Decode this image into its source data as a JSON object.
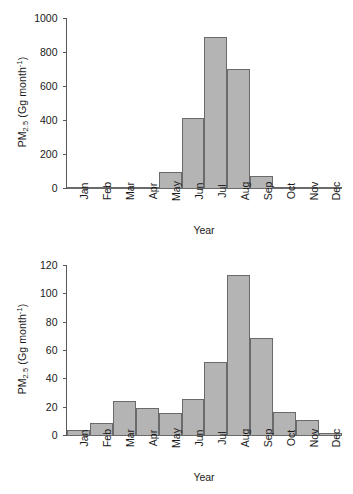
{
  "chart_data": [
    {
      "type": "bar",
      "panel": "top",
      "title": "",
      "xlabel": "Year",
      "ylabel": "PM2.5 (Gg month-1)",
      "ylabel_parts": {
        "prefix": "PM",
        "sub": "2.5",
        "mid": " (Gg month",
        "sup": "-1",
        "suffix": ")"
      },
      "categories": [
        "Jan",
        "Feb",
        "Mar",
        "Apr",
        "May",
        "Jun",
        "Jul",
        "Aug",
        "Sep",
        "Oct",
        "Nov",
        "Dec"
      ],
      "values": [
        2,
        2,
        2,
        3,
        100,
        415,
        897,
        708,
        78,
        14,
        10,
        4
      ],
      "ylim": [
        0,
        1000
      ],
      "yticks": [
        0,
        200,
        400,
        600,
        800,
        1000
      ],
      "ytick_labels": [
        "0",
        "200",
        "400",
        "600",
        "800",
        "1000"
      ],
      "grid": false,
      "legend": "none",
      "bar_color": "#b4b4b4",
      "bar_edge_color": "#6a6a6a",
      "axis_color": "#5a5a5a"
    },
    {
      "type": "bar",
      "panel": "bottom",
      "title": "",
      "xlabel": "Year",
      "ylabel": "PM2.5 (Gg month-1)",
      "ylabel_parts": {
        "prefix": "PM",
        "sub": "2.5",
        "mid": " (Gg month",
        "sup": "-1",
        "suffix": ")"
      },
      "categories": [
        "Jan",
        "Feb",
        "Mar",
        "Apr",
        "May",
        "Jun",
        "Jul",
        "Aug",
        "Sep",
        "Oct",
        "Nov",
        "Dec"
      ],
      "values": [
        4.5,
        9.5,
        25,
        20,
        16.5,
        26,
        52.5,
        114,
        69,
        17,
        11.5,
        2
      ],
      "ylim": [
        0,
        120
      ],
      "yticks": [
        0,
        20,
        40,
        60,
        80,
        100,
        120
      ],
      "ytick_labels": [
        "0",
        "20",
        "40",
        "60",
        "80",
        "100",
        "120"
      ],
      "grid": false,
      "legend": "none",
      "bar_color": "#b4b4b4",
      "bar_edge_color": "#6a6a6a",
      "axis_color": "#5a5a5a"
    }
  ]
}
